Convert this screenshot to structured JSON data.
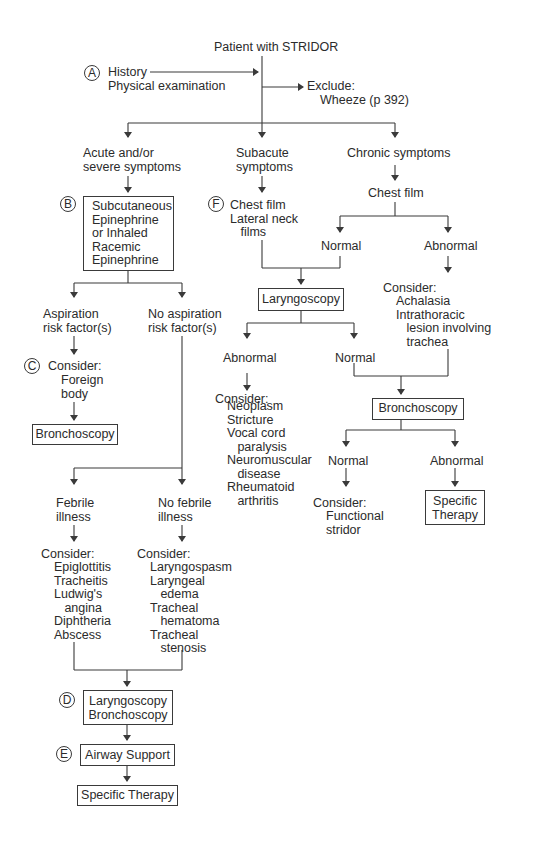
{
  "title": "Patient with STRIDOR",
  "step_a": {
    "marker": "A",
    "lines": "History\nPhysical examination"
  },
  "exclude": {
    "label": "Exclude:",
    "item": "Wheeze (p 392)"
  },
  "branches": {
    "acute": {
      "label": "Acute and/or\nsevere symptoms",
      "step_b": {
        "marker": "B",
        "box": "Subcutaneous\nEpinephrine\nor Inhaled\nRacemic\nEpinephrine"
      },
      "aspiration": {
        "label": "Aspiration\nrisk factor(s)",
        "step_c": {
          "marker": "C",
          "consider": "Consider:",
          "items": "Foreign\nbody"
        },
        "box": "Bronchoscopy"
      },
      "no_aspiration": {
        "label": "No aspiration\nrisk factor(s)",
        "febrile": {
          "label": "Febrile\nillness",
          "consider": "Consider:",
          "items": "Epiglottitis\nTracheitis\nLudwig's\n   angina\nDiphtheria\nAbscess"
        },
        "no_febrile": {
          "label": "No febrile\nillness",
          "consider": "Consider:",
          "items": "Laryngospasm\nLaryngeal\n   edema\nTracheal\n   hematoma\nTracheal\n   stenosis"
        }
      },
      "step_d": {
        "marker": "D",
        "box": "Laryngoscopy\nBronchoscopy"
      },
      "step_e": {
        "marker": "E",
        "box": "Airway Support"
      },
      "final_box": "Specific Therapy"
    },
    "subacute": {
      "label": "Subacute\nsymptoms",
      "step_f": {
        "marker": "F",
        "lines": "Chest film\nLateral neck\n   films"
      },
      "laryngoscopy_box": "Laryngoscopy",
      "abnormal": {
        "label": "Abnormal",
        "consider": "Consider:",
        "items": "Neoplasm\nStricture\nVocal cord\n   paralysis\nNeuromuscular\n   disease\nRheumatoid\n   arthritis"
      },
      "normal": {
        "label": "Normal"
      }
    },
    "chronic": {
      "label": "Chronic symptoms",
      "chest_film": "Chest film",
      "normal": {
        "label": "Normal"
      },
      "abnormal": {
        "label": "Abnormal",
        "consider": "Consider:",
        "items": "Achalasia\nIntrathoracic\n   lesion involving\n   trachea"
      },
      "bronchoscopy_box": "Bronchoscopy",
      "bronch_normal": {
        "label": "Normal",
        "consider": "Consider:",
        "items": "Functional\nstridor"
      },
      "bronch_abnormal": {
        "label": "Abnormal",
        "box": "Specific\nTherapy"
      }
    }
  },
  "colors": {
    "line": "#3a3a3a",
    "text": "#2b2b2b",
    "background": "#ffffff"
  }
}
